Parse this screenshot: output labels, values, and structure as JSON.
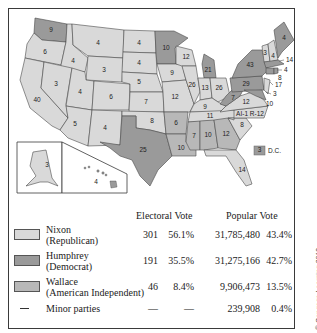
{
  "colors": {
    "nixon": "#d9d9d9",
    "humphrey": "#9a9a9a",
    "wallace": "#b8b8b8",
    "border": "#3a3a3a"
  },
  "map": {
    "title": "1968 Presidential Election",
    "states": [
      {
        "abbr": "WA",
        "votes": "9",
        "winner": "humphrey"
      },
      {
        "abbr": "OR",
        "votes": "6",
        "winner": "nixon"
      },
      {
        "abbr": "CA",
        "votes": "40",
        "winner": "nixon"
      },
      {
        "abbr": "ID",
        "votes": "4",
        "winner": "nixon"
      },
      {
        "abbr": "NV",
        "votes": "3",
        "winner": "nixon"
      },
      {
        "abbr": "MT",
        "votes": "4",
        "winner": "nixon"
      },
      {
        "abbr": "WY",
        "votes": "3",
        "winner": "nixon"
      },
      {
        "abbr": "UT",
        "votes": "4",
        "winner": "nixon"
      },
      {
        "abbr": "AZ",
        "votes": "5",
        "winner": "nixon"
      },
      {
        "abbr": "CO",
        "votes": "6",
        "winner": "nixon"
      },
      {
        "abbr": "NM",
        "votes": "4",
        "winner": "nixon"
      },
      {
        "abbr": "ND",
        "votes": "4",
        "winner": "nixon"
      },
      {
        "abbr": "SD",
        "votes": "4",
        "winner": "nixon"
      },
      {
        "abbr": "NE",
        "votes": "5",
        "winner": "nixon"
      },
      {
        "abbr": "KS",
        "votes": "7",
        "winner": "nixon"
      },
      {
        "abbr": "OK",
        "votes": "8",
        "winner": "nixon"
      },
      {
        "abbr": "TX",
        "votes": "25",
        "winner": "humphrey"
      },
      {
        "abbr": "MN",
        "votes": "10",
        "winner": "humphrey"
      },
      {
        "abbr": "IA",
        "votes": "9",
        "winner": "nixon"
      },
      {
        "abbr": "MO",
        "votes": "12",
        "winner": "nixon"
      },
      {
        "abbr": "AR",
        "votes": "6",
        "winner": "wallace"
      },
      {
        "abbr": "LA",
        "votes": "10",
        "winner": "wallace"
      },
      {
        "abbr": "WI",
        "votes": "12",
        "winner": "nixon"
      },
      {
        "abbr": "IL",
        "votes": "26",
        "winner": "nixon"
      },
      {
        "abbr": "MI",
        "votes": "21",
        "winner": "humphrey"
      },
      {
        "abbr": "IN",
        "votes": "13",
        "winner": "nixon"
      },
      {
        "abbr": "OH",
        "votes": "26",
        "winner": "nixon"
      },
      {
        "abbr": "KY",
        "votes": "9",
        "winner": "nixon"
      },
      {
        "abbr": "TN",
        "votes": "11",
        "winner": "nixon"
      },
      {
        "abbr": "MS",
        "votes": "7",
        "winner": "wallace"
      },
      {
        "abbr": "AL",
        "votes": "10",
        "winner": "wallace"
      },
      {
        "abbr": "GA",
        "votes": "12",
        "winner": "wallace"
      },
      {
        "abbr": "FL",
        "votes": "14",
        "winner": "nixon"
      },
      {
        "abbr": "SC",
        "votes": "8",
        "winner": "nixon"
      },
      {
        "abbr": "NC",
        "votes": "AI-1  R-12",
        "winner": "nixon"
      },
      {
        "abbr": "VA",
        "votes": "12",
        "winner": "nixon"
      },
      {
        "abbr": "WV",
        "votes": "7",
        "winner": "humphrey"
      },
      {
        "abbr": "PA",
        "votes": "29",
        "winner": "humphrey"
      },
      {
        "abbr": "NY",
        "votes": "43",
        "winner": "humphrey"
      },
      {
        "abbr": "VT",
        "votes": "3",
        "winner": "nixon"
      },
      {
        "abbr": "NH",
        "votes": "4",
        "winner": "nixon"
      },
      {
        "abbr": "ME",
        "votes": "4",
        "winner": "humphrey"
      },
      {
        "abbr": "MA",
        "votes": "14",
        "winner": "humphrey"
      },
      {
        "abbr": "RI",
        "votes": "4",
        "winner": "humphrey"
      },
      {
        "abbr": "CT",
        "votes": "8",
        "winner": "humphrey"
      },
      {
        "abbr": "NJ",
        "votes": "17",
        "winner": "nixon"
      },
      {
        "abbr": "DE",
        "votes": "3",
        "winner": "nixon"
      },
      {
        "abbr": "MD",
        "votes": "10",
        "winner": "humphrey"
      },
      {
        "abbr": "AK",
        "votes": "3",
        "winner": "nixon"
      },
      {
        "abbr": "HI",
        "votes": "4",
        "winner": "humphrey"
      }
    ],
    "dc": {
      "votes": "3",
      "label": "D.C.",
      "winner": "humphrey"
    }
  },
  "legend": {
    "headers": {
      "electoral": "Electoral Vote",
      "popular": "Popular Vote"
    },
    "rows": [
      {
        "name": "Nixon",
        "party": "(Republican)",
        "ev": "301",
        "ev_pct": "56.1%",
        "pv": "31,785,480",
        "pv_pct": "43.4%",
        "swatch": "nixon"
      },
      {
        "name": "Humphrey",
        "party": "(Democrat)",
        "ev": "191",
        "ev_pct": "35.5%",
        "pv": "31,275,166",
        "pv_pct": "42.7%",
        "swatch": "humphrey"
      },
      {
        "name": "Wallace",
        "party": "(American Independent)",
        "ev": "46",
        "ev_pct": "8.4%",
        "pv": "9,906,473",
        "pv_pct": "13.5%",
        "swatch": "wallace"
      },
      {
        "name": "Minor parties",
        "party": "",
        "ev": "—",
        "ev_pct": "—",
        "pv": "239,908",
        "pv_pct": "0.4%",
        "swatch": "dash"
      }
    ]
  },
  "copyright": "© Cengage Learning 2013"
}
